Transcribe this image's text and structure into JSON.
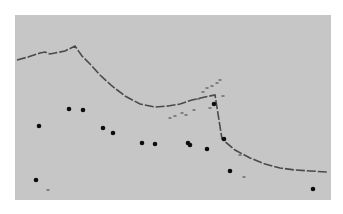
{
  "chart_data": {
    "type": "scatter",
    "title": "",
    "xlabel": "",
    "ylabel": "",
    "grid": false,
    "legend": null,
    "panel": {
      "x": 15,
      "y": 15,
      "width": 316,
      "height": 185,
      "fill": "#c6c6c6"
    },
    "colors": {
      "line": "#4a4a4a",
      "points": "#0d0d0d",
      "faint": "#6f6f6f"
    },
    "series": [
      {
        "name": "curve",
        "kind": "line",
        "points_px": [
          [
            17,
            60
          ],
          [
            28,
            57
          ],
          [
            40,
            53
          ],
          [
            45,
            52
          ],
          [
            50,
            54
          ],
          [
            55,
            53
          ],
          [
            65,
            51
          ],
          [
            75,
            46
          ],
          [
            82,
            56
          ],
          [
            90,
            64
          ],
          [
            100,
            75
          ],
          [
            112,
            86
          ],
          [
            125,
            96
          ],
          [
            140,
            104
          ],
          [
            155,
            107
          ],
          [
            168,
            106
          ],
          [
            180,
            104
          ],
          [
            192,
            100
          ],
          [
            205,
            97
          ],
          [
            215,
            95
          ],
          [
            222,
            139
          ],
          [
            235,
            150
          ],
          [
            250,
            158
          ],
          [
            265,
            164
          ],
          [
            280,
            168
          ],
          [
            295,
            170
          ],
          [
            310,
            171
          ],
          [
            328,
            172
          ]
        ]
      },
      {
        "name": "points",
        "kind": "scatter",
        "points_px": [
          [
            39,
            126
          ],
          [
            69,
            109
          ],
          [
            83,
            110
          ],
          [
            103,
            128
          ],
          [
            113,
            133
          ],
          [
            142,
            143
          ],
          [
            155,
            144
          ],
          [
            188,
            143
          ],
          [
            190,
            145
          ],
          [
            207,
            149
          ],
          [
            214,
            104
          ],
          [
            224,
            139
          ],
          [
            230,
            171
          ],
          [
            36,
            180
          ],
          [
            313,
            189
          ]
        ]
      },
      {
        "name": "noise",
        "kind": "scatter",
        "points_px": [
          [
            170,
            118
          ],
          [
            175,
            116
          ],
          [
            182,
            113
          ],
          [
            186,
            115
          ],
          [
            194,
            110
          ],
          [
            198,
            99
          ],
          [
            203,
            92
          ],
          [
            207,
            88
          ],
          [
            212,
            86
          ],
          [
            217,
            83
          ],
          [
            220,
            80
          ],
          [
            223,
            96
          ],
          [
            210,
            108
          ],
          [
            240,
            155
          ],
          [
            244,
            177
          ],
          [
            48,
            190
          ]
        ]
      }
    ]
  }
}
